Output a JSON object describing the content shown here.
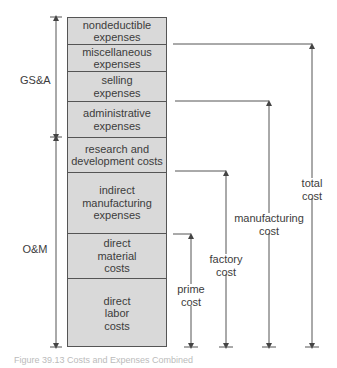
{
  "diagram": {
    "blocks": [
      {
        "label": "nondeductible\nexpenses"
      },
      {
        "label": "miscellaneous\nexpenses"
      },
      {
        "label": "selling\nexpenses"
      },
      {
        "label": "administrative\nexpenses"
      },
      {
        "label": "research and\ndevelopment costs"
      },
      {
        "label": "indirect\nmanufacturing\nexpenses"
      },
      {
        "label": "direct\nmaterial\ncosts"
      },
      {
        "label": "direct\nlabor\ncosts"
      }
    ],
    "left_groups": [
      {
        "label": "GS&A"
      },
      {
        "label": "O&M"
      }
    ],
    "right_brackets": [
      {
        "label": "prime\ncost"
      },
      {
        "label": "factory\ncost"
      },
      {
        "label": "manufacturing\ncost"
      },
      {
        "label": "total\ncost"
      }
    ],
    "fill_color": "#d9d9d9",
    "line_color": "#555555"
  },
  "caption": "Figure 39.13 Costs and Expenses Combined"
}
